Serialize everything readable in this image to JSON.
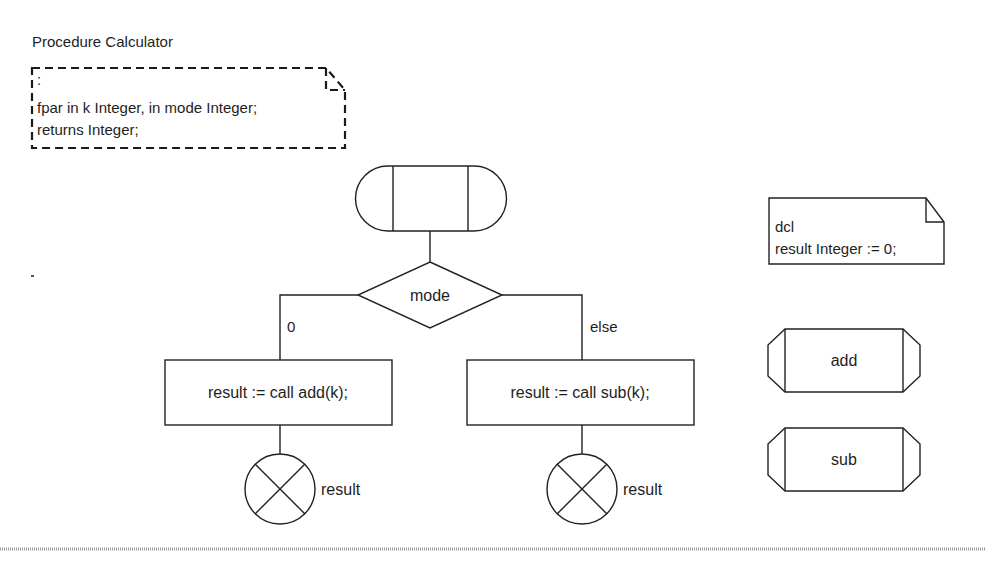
{
  "diagram": {
    "title": "Procedure Calculator",
    "parameters_text": {
      "line1": ":",
      "line2": "fpar in k Integer, in mode Integer;",
      "line3": "returns Integer;"
    },
    "declaration_text": {
      "line1": "dcl",
      "line2": "result Integer := 0;"
    },
    "start_symbol": "procedure-start",
    "decision": {
      "label": "mode",
      "branches": [
        {
          "answer": "0",
          "task": "result := call add(k);",
          "return_label": "result"
        },
        {
          "answer": "else",
          "task": "result := call sub(k);",
          "return_label": "result"
        }
      ]
    },
    "procedure_references": [
      {
        "label": "add"
      },
      {
        "label": "sub"
      }
    ],
    "colors": {
      "line": "#222222",
      "background": "#ffffff",
      "rule": "#9a9a9a"
    }
  }
}
